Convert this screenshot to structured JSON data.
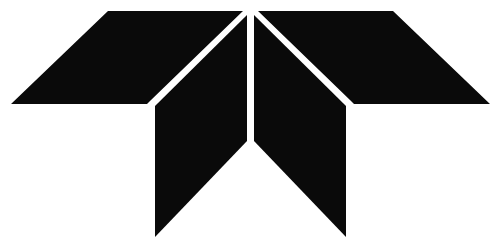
{
  "canvas": {
    "width": 501,
    "height": 251,
    "background_color": "#ffffff"
  },
  "logo": {
    "name": "teledyne-logo",
    "description": "Abstract geometric T mark formed by four black angular shapes separated by thin white gaps",
    "mark_color": "#0a0a0a",
    "gap_color": "#ffffff",
    "shapes": [
      {
        "name": "left-wing",
        "points": "108,11 243,11 151,100 147,104 11,104"
      },
      {
        "name": "right-wing",
        "points": "258,11 393,11 490,104 354,104 350,100"
      },
      {
        "name": "left-leg",
        "points": "155,106 247,15 247,141 155,237"
      },
      {
        "name": "right-leg",
        "points": "254,15 346,106 346,237 254,141"
      }
    ]
  }
}
